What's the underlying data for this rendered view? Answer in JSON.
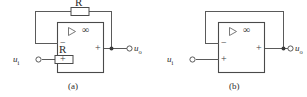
{
  "figure": {
    "background_color": "#ffffff",
    "line_color": "#5a5a5a",
    "text_color": "#2b2b2b"
  },
  "circuits": [
    {
      "id": "a",
      "caption": "(a)",
      "name": "inverting-amplifier",
      "input_label": "u",
      "input_sub": "i",
      "output_label": "u",
      "output_sub": "o",
      "opamp": {
        "triangle_icon": "triangle-right-icon",
        "gain_symbol": "∞",
        "minus_terminal": "−",
        "plus_terminal": "+",
        "output_terminal": "+"
      },
      "resistors": [
        {
          "name": "input-resistor",
          "label": "R"
        },
        {
          "name": "feedback-resistor",
          "label": "R"
        }
      ]
    },
    {
      "id": "b",
      "caption": "(b)",
      "name": "voltage-follower",
      "input_label": "u",
      "input_sub": "i",
      "output_label": "u",
      "output_sub": "o",
      "opamp": {
        "triangle_icon": "triangle-right-icon",
        "gain_symbol": "∞",
        "minus_terminal": "−",
        "plus_terminal": "+",
        "output_terminal": "+"
      },
      "resistors": []
    }
  ]
}
